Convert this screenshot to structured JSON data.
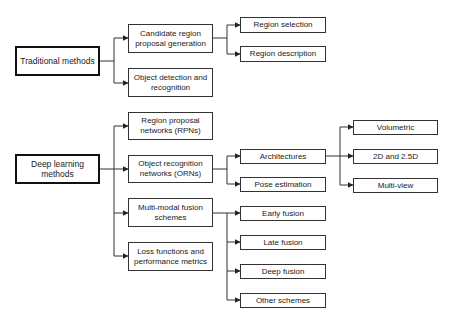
{
  "diagram": {
    "type": "tree",
    "line_color": "#333333",
    "roots": [
      {
        "id": "traditional",
        "label": "Traditional methods",
        "children": [
          {
            "id": "candidate",
            "label": "Candidate region proposal generation",
            "children": [
              {
                "id": "region_selection",
                "label": "Region selection"
              },
              {
                "id": "region_description",
                "label": "Region description"
              }
            ]
          },
          {
            "id": "object_detection",
            "label": "Object detection and recognition"
          }
        ]
      },
      {
        "id": "deep_learning",
        "label": "Deep learning methods",
        "children": [
          {
            "id": "rpns",
            "label": "Region proposal networks (RPNs)"
          },
          {
            "id": "orns",
            "label": "Object recognition networks (ORNs)",
            "children": [
              {
                "id": "architectures",
                "label": "Architectures",
                "children": [
                  {
                    "id": "volumetric",
                    "label": "Volumetric"
                  },
                  {
                    "id": "2d_25d",
                    "label": "2D and 2.5D"
                  },
                  {
                    "id": "multiview",
                    "label": "Multi-view"
                  }
                ]
              },
              {
                "id": "pose",
                "label": "Pose estimation"
              }
            ]
          },
          {
            "id": "fusion",
            "label": "Multi-modal fusion schemes",
            "children": [
              {
                "id": "early",
                "label": "Early fusion"
              },
              {
                "id": "late",
                "label": "Late fusion"
              },
              {
                "id": "deep",
                "label": "Deep fusion"
              },
              {
                "id": "other",
                "label": "Other schemes"
              }
            ]
          },
          {
            "id": "loss",
            "label": "Loss functions and performance metrics"
          }
        ]
      }
    ]
  },
  "labels": {
    "traditional": "Traditional methods",
    "candidate": "Candidate region proposal generation",
    "region_selection": "Region selection",
    "region_description": "Region description",
    "object_detection": "Object detection and recognition",
    "deep_learning": "Deep learning methods",
    "rpns": "Region proposal networks (RPNs)",
    "orns": "Object recognition networks (ORNs)",
    "fusion": "Multi-modal fusion schemes",
    "loss": "Loss functions and performance metrics",
    "architectures": "Architectures",
    "pose": "Pose estimation",
    "early": "Early fusion",
    "late": "Late fusion",
    "deep": "Deep fusion",
    "other": "Other schemes",
    "volumetric": "Volumetric",
    "d2_25d": "2D and 2.5D",
    "multiview": "Multi-view"
  }
}
